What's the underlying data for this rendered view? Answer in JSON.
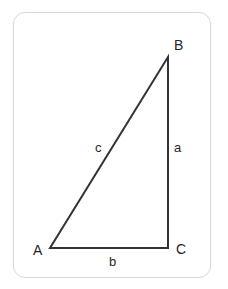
{
  "figure": {
    "kind": "right-triangle-diagram",
    "card": {
      "border_color": "#d8d8d8",
      "background_color": "#ffffff",
      "corner_radius_px": 12
    },
    "stroke": {
      "color": "#333333",
      "width_px": 2
    },
    "text_color": "#262626",
    "vertices": [
      {
        "id": "A",
        "label": "A",
        "x": 50,
        "y": 248
      },
      {
        "id": "B",
        "label": "B",
        "x": 168,
        "y": 57
      },
      {
        "id": "C",
        "label": "C",
        "x": 168,
        "y": 248
      }
    ],
    "sides": [
      {
        "id": "a",
        "label": "a",
        "from": "B",
        "to": "C",
        "note": "vertical leg"
      },
      {
        "id": "b",
        "label": "b",
        "from": "A",
        "to": "C",
        "note": "horizontal leg"
      },
      {
        "id": "c",
        "label": "c",
        "from": "A",
        "to": "B",
        "note": "hypotenuse"
      }
    ],
    "path_points": "50,248 168,57 168,248"
  }
}
